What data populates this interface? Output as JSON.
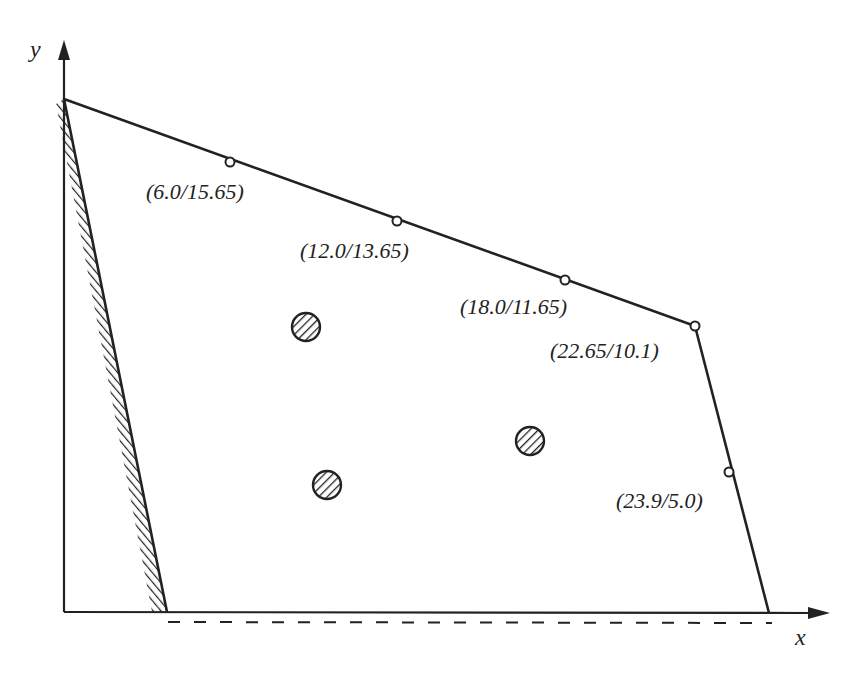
{
  "diagram": {
    "type": "polygon_region_with_points",
    "axes": {
      "x_label": "x",
      "y_label": "y"
    },
    "boundary_points": [
      {
        "label": "(6.0/15.65)",
        "x": 6.0,
        "y": 15.65
      },
      {
        "label": "(12.0/13.65)",
        "x": 12.0,
        "y": 13.65
      },
      {
        "label": "(18.0/11.65)",
        "x": 18.0,
        "y": 11.65
      },
      {
        "label": "(22.65/10.1)",
        "x": 22.65,
        "y": 10.1
      },
      {
        "label": "(23.9/5.0)",
        "x": 23.9,
        "y": 5.0
      }
    ],
    "interior_markers": 3,
    "hatched_edge": "left slanted boundary",
    "dashed_line": "below x-axis, along bottom edge"
  },
  "labels": {
    "x_axis": "x",
    "y_axis": "y",
    "p1": "(6.0/15.65)",
    "p2": "(12.0/13.65)",
    "p3": "(18.0/11.65)",
    "p4": "(22.65/10.1)",
    "p5": "(23.9/5.0)"
  },
  "colors": {
    "ink": "#222222",
    "background": "#ffffff"
  }
}
